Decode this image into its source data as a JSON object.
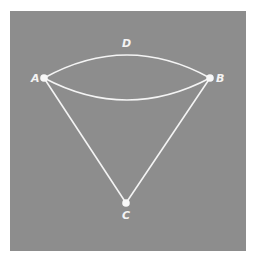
{
  "diagram": {
    "type": "graph",
    "background_color": "#8d8d8d",
    "line_color": "#f4f4f4",
    "nodes": [
      {
        "id": "A",
        "label": "A",
        "x": 44,
        "y": 78,
        "label_x": 31,
        "label_y": 82
      },
      {
        "id": "B",
        "label": "B",
        "x": 210,
        "y": 78,
        "label_x": 216,
        "label_y": 82
      },
      {
        "id": "C",
        "label": "C",
        "x": 126,
        "y": 203,
        "label_x": 122,
        "label_y": 219
      }
    ],
    "edges": [
      {
        "from": "A",
        "to": "B",
        "shape": "upper-arc",
        "label": "D"
      },
      {
        "from": "A",
        "to": "B",
        "shape": "lower-arc"
      },
      {
        "from": "A",
        "to": "C",
        "shape": "straight"
      },
      {
        "from": "B",
        "to": "C",
        "shape": "straight"
      }
    ],
    "edge_label": {
      "text": "D",
      "x": 122,
      "y": 47
    }
  }
}
